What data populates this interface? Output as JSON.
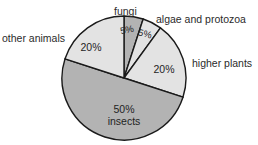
{
  "chart_data": {
    "type": "pie",
    "title": "",
    "xlabel": "",
    "ylabel": "",
    "grid": false,
    "legend_position": "outside-labels",
    "total": 100,
    "unit": "%",
    "start_angle_deg": 0,
    "direction": "clockwise",
    "categories": [
      "fungi",
      "algae and protozoa",
      "higher plants",
      "insects",
      "other animals"
    ],
    "values": [
      5,
      5,
      20,
      50,
      20
    ],
    "slices": [
      {
        "label": "fungi",
        "value": 5,
        "value_label": "5%",
        "inner_label": "5%",
        "outer_label": "fungi",
        "color": "#b3b3b3",
        "start_deg": 0,
        "end_deg": 18
      },
      {
        "label": "algae and protozoa",
        "value": 5,
        "value_label": "5%",
        "inner_label": "5%",
        "outer_label": "algae and protozoa",
        "color": "#e3e3e3",
        "start_deg": 18,
        "end_deg": 36
      },
      {
        "label": "higher plants",
        "value": 20,
        "value_label": "20%",
        "inner_label": "20%",
        "outer_label": "higher plants",
        "color": "#e3e3e3",
        "start_deg": 36,
        "end_deg": 108
      },
      {
        "label": "insects",
        "value": 50,
        "value_label": "50%",
        "inner_label": "50%\ninsects",
        "inner_label_line1": "50%",
        "inner_label_line2": "insects",
        "outer_label": "",
        "color": "#b3b3b3",
        "start_deg": 108,
        "end_deg": 288
      },
      {
        "label": "other animals",
        "value": 20,
        "value_label": "20%",
        "inner_label": "20%",
        "outer_label": "other animals",
        "color": "#e3e3e3",
        "start_deg": 288,
        "end_deg": 360
      }
    ],
    "geometry": {
      "center_x": 124,
      "center_y": 78,
      "radius": 62
    },
    "style": {
      "outline_color": "#1a1a1a",
      "outline_width": 1.4,
      "background": "#ffffff",
      "light_gray": "#e3e3e3",
      "medium_gray": "#b3b3b3"
    }
  }
}
